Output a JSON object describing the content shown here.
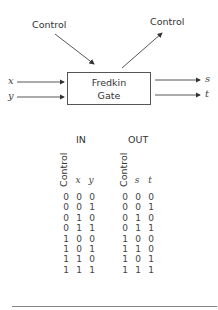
{
  "diagram": {
    "control_in_label": "Control",
    "control_out_label": "Control",
    "gate_line1": "Fredkin",
    "gate_line2": "Gate",
    "inputs": [
      "x",
      "y"
    ],
    "outputs": [
      "s",
      "t"
    ]
  },
  "truth_table": {
    "in_header": "IN",
    "out_header": "OUT",
    "in_columns": [
      "Control",
      "x",
      "y"
    ],
    "out_columns": [
      "Control",
      "s",
      "t"
    ],
    "rows": [
      {
        "in": [
          "0",
          "0",
          "0"
        ],
        "out": [
          "0",
          "0",
          "0"
        ]
      },
      {
        "in": [
          "0",
          "0",
          "1"
        ],
        "out": [
          "0",
          "0",
          "1"
        ]
      },
      {
        "in": [
          "0",
          "1",
          "0"
        ],
        "out": [
          "0",
          "1",
          "0"
        ]
      },
      {
        "in": [
          "0",
          "1",
          "1"
        ],
        "out": [
          "0",
          "1",
          "1"
        ]
      },
      {
        "in": [
          "1",
          "0",
          "0"
        ],
        "out": [
          "1",
          "0",
          "0"
        ]
      },
      {
        "in": [
          "1",
          "0",
          "1"
        ],
        "out": [
          "1",
          "1",
          "0"
        ]
      },
      {
        "in": [
          "1",
          "1",
          "0"
        ],
        "out": [
          "1",
          "0",
          "1"
        ]
      },
      {
        "in": [
          "1",
          "1",
          "1"
        ],
        "out": [
          "1",
          "1",
          "1"
        ]
      }
    ]
  }
}
